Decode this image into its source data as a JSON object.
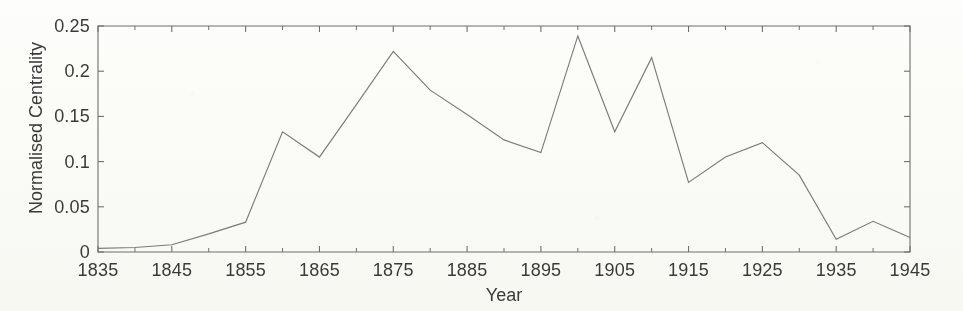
{
  "chart_data": {
    "type": "line",
    "title": "",
    "subtitle": "",
    "xlabel": "Year",
    "ylabel": "Normalised Centrality",
    "xlim": [
      1835,
      1945
    ],
    "ylim": [
      0,
      0.25
    ],
    "grid": false,
    "legend": "none",
    "x_tick_labels": [
      "1835",
      "1845",
      "1855",
      "1865",
      "1875",
      "1885",
      "1895",
      "1905",
      "1915",
      "1925",
      "1935",
      "1945"
    ],
    "x_tick_values": [
      1835,
      1845,
      1855,
      1865,
      1875,
      1885,
      1895,
      1905,
      1915,
      1925,
      1935,
      1945
    ],
    "x_minor_tick_values": [
      1840,
      1850,
      1860,
      1870,
      1880,
      1890,
      1900,
      1910,
      1920,
      1930,
      1940
    ],
    "y_tick_labels": [
      "0",
      "0.05",
      "0.1",
      "0.15",
      "0.2",
      "0.25"
    ],
    "y_tick_values": [
      0,
      0.05,
      0.1,
      0.15,
      0.2,
      0.25
    ],
    "series": [
      {
        "name": "Normalised Centrality",
        "color": "#7b7b7b",
        "x": [
          1835,
          1840,
          1845,
          1850,
          1855,
          1860,
          1865,
          1870,
          1875,
          1880,
          1885,
          1890,
          1895,
          1900,
          1905,
          1910,
          1915,
          1920,
          1925,
          1930,
          1935,
          1940,
          1945
        ],
        "values": [
          0.004,
          0.005,
          0.008,
          0.02,
          0.033,
          0.133,
          0.105,
          0.163,
          0.222,
          0.179,
          0.152,
          0.124,
          0.11,
          0.239,
          0.133,
          0.215,
          0.077,
          0.105,
          0.121,
          0.085,
          0.014,
          0.034,
          0.016
        ]
      }
    ]
  },
  "style": {
    "axis_color": "#6f6f6f",
    "text_color": "#3a3a3a",
    "background": "#fdfdfb",
    "line_color": "#7b7b7b"
  }
}
